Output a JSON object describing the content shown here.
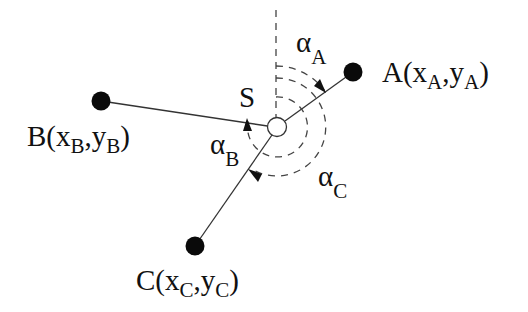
{
  "diagram": {
    "type": "geometry-angles",
    "center": {
      "label": "S",
      "x": 277,
      "y": 127,
      "r": 9.5
    },
    "points": [
      {
        "id": "A",
        "label": "A",
        "coord_x": "x",
        "coord_y": "y",
        "sub": "A",
        "x": 353,
        "y": 72
      },
      {
        "id": "B",
        "label": "B",
        "coord_x": "x",
        "coord_y": "y",
        "sub": "B",
        "x": 101,
        "y": 101
      },
      {
        "id": "C",
        "label": "C",
        "coord_x": "x",
        "coord_y": "y",
        "sub": "C",
        "x": 195,
        "y": 246
      }
    ],
    "angles": [
      {
        "id": "alpha_A",
        "symbol": "α",
        "sub": "A",
        "radius": 61,
        "to_point": "A"
      },
      {
        "id": "alpha_B",
        "symbol": "α",
        "sub": "B",
        "radius": 30,
        "to_point": "B"
      },
      {
        "id": "alpha_C",
        "symbol": "α",
        "sub": "C",
        "radius": 49,
        "to_point": "C"
      }
    ],
    "reference_line": "vertical dashed line through S",
    "colors": {
      "ink": "#111111",
      "line": "#333333",
      "background": "#ffffff"
    }
  },
  "labels": {
    "S": "S",
    "A": {
      "main": "A(x",
      "sub1": "A",
      "mid": ",y",
      "sub2": "A",
      "end": ")"
    },
    "B": {
      "main": "B(x",
      "sub1": "B",
      "mid": ",y",
      "sub2": "B",
      "end": ")"
    },
    "C": {
      "main": "C(x",
      "sub1": "C",
      "mid": ",y",
      "sub2": "C",
      "end": ")"
    },
    "alpha_A": {
      "sym": "α",
      "sub": "A"
    },
    "alpha_B": {
      "sym": "α",
      "sub": "B"
    },
    "alpha_C": {
      "sym": "α",
      "sub": "C"
    }
  }
}
